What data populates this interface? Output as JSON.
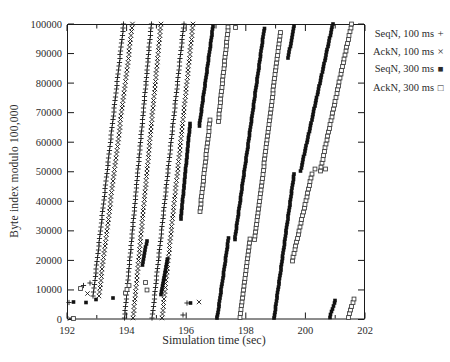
{
  "figure": {
    "type_note": "scatter trace plot, gnuplot style, black on white"
  },
  "chart_data": {
    "type": "scatter",
    "title": "",
    "xlabel": "Simulation time (sec)",
    "ylabel": "Byte index modulo 100,000",
    "xlim": [
      192,
      202
    ],
    "ylim": [
      0,
      100000
    ],
    "x_ticks": [
      192,
      194,
      196,
      198,
      200,
      202
    ],
    "x_minor_ticks": [
      193,
      195,
      197,
      199,
      201
    ],
    "y_ticks": [
      0,
      10000,
      20000,
      30000,
      40000,
      50000,
      60000,
      70000,
      80000,
      90000,
      100000
    ],
    "grid": false,
    "legend_position": "top-right-outside",
    "axis_color": "#1a1a1a",
    "text_color": "#2b2b2b",
    "series": [
      {
        "name": "SeqN, 100 ms",
        "marker": "plus",
        "glyph": "+",
        "color": "#1a1a1a",
        "step": 1300,
        "segments": [
          [
            192.88,
            8000,
            193.9,
            100000
          ],
          [
            193.93,
            500,
            194.83,
            100000
          ],
          [
            194.86,
            500,
            195.92,
            100000
          ]
        ],
        "points": [
          [
            192.07,
            5800
          ],
          [
            192.56,
            11500
          ],
          [
            192.77,
            12300
          ],
          [
            195.9,
            1500
          ],
          [
            196.02,
            5500
          ]
        ]
      },
      {
        "name": "AckN, 100 ms",
        "marker": "cross",
        "glyph": "×",
        "color": "#1a1a1a",
        "step": 1300,
        "segments": [
          [
            193.07,
            8000,
            194.2,
            100000
          ],
          [
            194.22,
            500,
            195.15,
            100000
          ],
          [
            195.19,
            500,
            196.23,
            100000
          ]
        ],
        "points": [
          [
            192.1,
            300
          ],
          [
            192.69,
            8800
          ],
          [
            196.43,
            6000
          ]
        ]
      },
      {
        "name": "SeqN, 300 ms",
        "marker": "filled-square",
        "glyph": "■",
        "color": "#111111",
        "step": 950,
        "segments": [
          [
            194.53,
            18500,
            194.68,
            26500
          ],
          [
            195.15,
            8500,
            195.38,
            20500
          ],
          [
            195.82,
            34000,
            196.13,
            66300
          ],
          [
            196.44,
            65500,
            196.9,
            99200
          ],
          [
            197.04,
            500,
            197.42,
            27500
          ],
          [
            197.63,
            27000,
            198.62,
            98500
          ],
          [
            198.95,
            500,
            199.62,
            49300
          ],
          [
            199.42,
            88500,
            199.62,
            99400
          ],
          [
            199.84,
            50300,
            200.92,
            100000
          ],
          [
            200.82,
            700,
            201.0,
            6500
          ]
        ],
        "points": [
          [
            192.22,
            5900
          ],
          [
            192.63,
            5800
          ],
          [
            192.97,
            6800
          ],
          [
            193.55,
            7300
          ],
          [
            196.15,
            5600
          ]
        ]
      },
      {
        "name": "AckN, 300 ms",
        "marker": "open-square",
        "glyph": "□",
        "color": "#3c3c3c",
        "step": 1300,
        "segments": [
          [
            196.46,
            36500,
            196.8,
            67500
          ],
          [
            197.08,
            67000,
            197.41,
            99000
          ],
          [
            197.81,
            700,
            198.14,
            27200
          ],
          [
            198.3,
            27000,
            199.16,
            97200
          ],
          [
            199.56,
            19800,
            200.22,
            49200
          ],
          [
            200.5,
            50300,
            201.55,
            100000
          ],
          [
            201.44,
            700,
            201.63,
            7000
          ]
        ],
        "points": [
          [
            192.21,
            300
          ],
          [
            192.46,
            10500
          ],
          [
            193.97,
            8900
          ],
          [
            194.02,
            10200
          ],
          [
            194.08,
            11500
          ],
          [
            194.63,
            12500
          ],
          [
            194.69,
            10000
          ],
          [
            197.66,
            98900
          ],
          [
            200.33,
            51000
          ],
          [
            200.67,
            51000
          ]
        ]
      }
    ],
    "plot_box_px": {
      "left": 67,
      "top": 24,
      "width": 298,
      "height": 295.5
    }
  }
}
